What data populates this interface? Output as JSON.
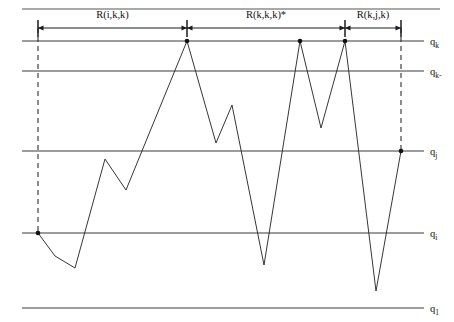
{
  "figure": {
    "width": 454,
    "height": 322,
    "background": "#ffffff",
    "line_color": "#2b2b2b",
    "axis_color": "#3a3a3a",
    "rule_color": "#8d8d8d"
  },
  "top_rule": {
    "y": 9,
    "x1": 22,
    "x2": 440
  },
  "axes": [
    {
      "id": "qk",
      "label_base": "q",
      "label_sub": "k",
      "y": 41,
      "x1": 22,
      "x2": 424
    },
    {
      "id": "qkm1",
      "label_base": "q",
      "label_sub": "k-",
      "y": 71,
      "x1": 22,
      "x2": 424
    },
    {
      "id": "qj",
      "label_base": "q",
      "label_sub": "j",
      "y": 151,
      "x1": 22,
      "x2": 424
    },
    {
      "id": "qi",
      "label_base": "q",
      "label_sub": "i",
      "y": 233,
      "x1": 22,
      "x2": 424
    },
    {
      "id": "q1",
      "label_base": "q",
      "label_sub": "1",
      "y": 308,
      "x1": 22,
      "x2": 424
    }
  ],
  "dashed_guides": [
    {
      "id": "left-guide",
      "x": 38,
      "y1": 28,
      "y2": 233
    },
    {
      "id": "right-guide",
      "x": 401,
      "y1": 28,
      "y2": 151
    }
  ],
  "measure_row": {
    "y": 28,
    "tick_top": 20,
    "tick_bottom": 37,
    "label_y": 18,
    "ticks": [
      38,
      187,
      345,
      401
    ],
    "segments": [
      {
        "id": "r-i-k-k",
        "label": "R(i,k,k)",
        "x1": 38,
        "x2": 187
      },
      {
        "id": "r-k-k-k",
        "label": "R(k,k,k)*",
        "x1": 187,
        "x2": 345
      },
      {
        "id": "r-k-j-k",
        "label": "R(k,j,k)",
        "x1": 345,
        "x2": 401
      }
    ]
  },
  "walk": {
    "id": "random-walk-path",
    "points": [
      [
        38,
        233
      ],
      [
        55,
        256
      ],
      [
        75,
        268
      ],
      [
        105,
        159
      ],
      [
        126,
        190
      ],
      [
        187,
        41
      ],
      [
        216,
        143
      ],
      [
        232,
        105
      ],
      [
        264,
        265
      ],
      [
        300,
        41
      ],
      [
        321,
        128
      ],
      [
        345,
        41
      ],
      [
        376,
        291
      ],
      [
        401,
        151
      ]
    ]
  },
  "marked_nodes": [
    {
      "id": "node-start",
      "x": 38,
      "y": 233
    },
    {
      "id": "node-k1",
      "x": 187,
      "y": 41
    },
    {
      "id": "node-k2",
      "x": 300,
      "y": 41
    },
    {
      "id": "node-k3",
      "x": 345,
      "y": 41
    },
    {
      "id": "node-end",
      "x": 401,
      "y": 151
    }
  ]
}
